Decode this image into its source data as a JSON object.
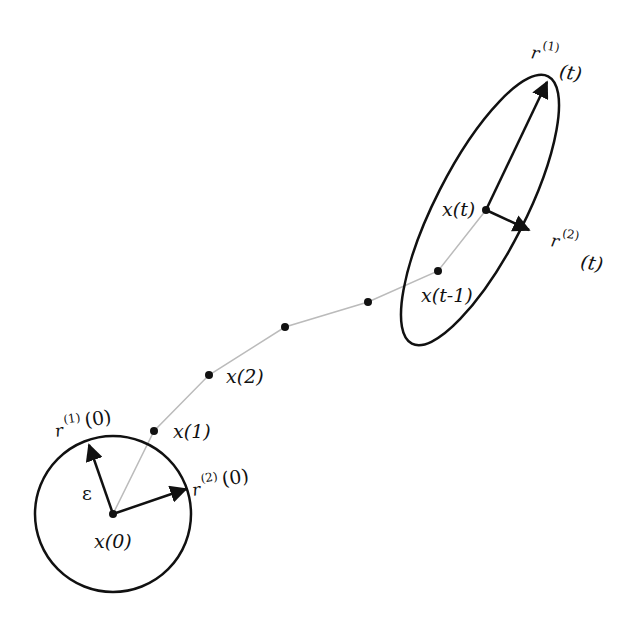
{
  "diagram": {
    "colors": {
      "stroke": "#111111",
      "trajectory": "#bbbbbb",
      "background": "#ffffff"
    },
    "start": {
      "point_label": "x(0)",
      "radius_label": "ε",
      "vector1_label": {
        "base": "r",
        "sup": "(1)",
        "arg": "(0)"
      },
      "vector2_label": {
        "base": "r",
        "sup": "(2)",
        "arg": "(0)"
      }
    },
    "trajectory_points": [
      {
        "label": "x(1)"
      },
      {
        "label": "x(2)"
      },
      {
        "label": ""
      },
      {
        "label": ""
      },
      {
        "label": "x(t-1)"
      }
    ],
    "end": {
      "point_label": "x(t)",
      "vector1_label": {
        "base": "r",
        "sup": "(1)",
        "arg": "(t)"
      },
      "vector2_label": {
        "base": "r",
        "sup": "(2)",
        "arg": "(t)"
      }
    }
  }
}
